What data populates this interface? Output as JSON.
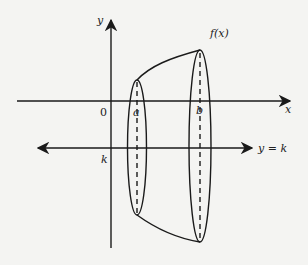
{
  "diagram": {
    "colors": {
      "background": "#f4f4f2",
      "ink": "#1a1a1a"
    },
    "labels": {
      "y_axis": "y",
      "x_axis": "x",
      "origin": "0",
      "a": "a",
      "b": "b",
      "k": "k",
      "function": "f(x)",
      "axis_of_rotation": "y = k"
    }
  }
}
